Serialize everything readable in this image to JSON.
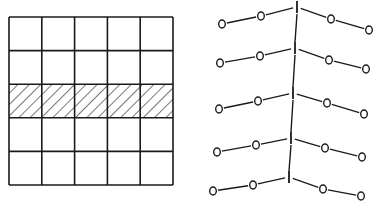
{
  "colors": {
    "ink": "#1a1a1a",
    "background": "#ffffff"
  },
  "grid_panel": {
    "rows": 5,
    "cols": 5,
    "x": 9,
    "y": 17,
    "width": 164,
    "height": 168,
    "hatched_row_index": 2,
    "hatch_pattern": "diagonal"
  },
  "chain_panel": {
    "atom_label_oxygen": "O",
    "atom_label_iodine": "I",
    "rows": [
      {
        "atoms": [
          {
            "label": "O",
            "x": 222,
            "y": 24
          },
          {
            "label": "O",
            "x": 261,
            "y": 16
          },
          {
            "label": "I",
            "x": 297,
            "y": 7
          },
          {
            "label": "O",
            "x": 331,
            "y": 19
          },
          {
            "label": "O",
            "x": 369,
            "y": 30
          }
        ]
      },
      {
        "atoms": [
          {
            "label": "O",
            "x": 220,
            "y": 63
          },
          {
            "label": "O",
            "x": 260,
            "y": 56
          },
          {
            "label": "I",
            "x": 295,
            "y": 48
          },
          {
            "label": "O",
            "x": 329,
            "y": 60
          },
          {
            "label": "O",
            "x": 366,
            "y": 69
          }
        ]
      },
      {
        "atoms": [
          {
            "label": "O",
            "x": 219,
            "y": 109
          },
          {
            "label": "O",
            "x": 258,
            "y": 101
          },
          {
            "label": "I",
            "x": 293,
            "y": 93
          },
          {
            "label": "O",
            "x": 327,
            "y": 103
          },
          {
            "label": "O",
            "x": 364,
            "y": 114
          }
        ]
      },
      {
        "atoms": [
          {
            "label": "O",
            "x": 217,
            "y": 152
          },
          {
            "label": "O",
            "x": 256,
            "y": 145
          },
          {
            "label": "I",
            "x": 291,
            "y": 138
          },
          {
            "label": "O",
            "x": 325,
            "y": 148
          },
          {
            "label": "O",
            "x": 362,
            "y": 157
          }
        ]
      },
      {
        "atoms": [
          {
            "label": "O",
            "x": 213,
            "y": 191
          },
          {
            "label": "O",
            "x": 253,
            "y": 185
          },
          {
            "label": "I",
            "x": 289,
            "y": 177
          },
          {
            "label": "O",
            "x": 323,
            "y": 189
          },
          {
            "label": "O",
            "x": 361,
            "y": 196
          }
        ]
      }
    ]
  }
}
